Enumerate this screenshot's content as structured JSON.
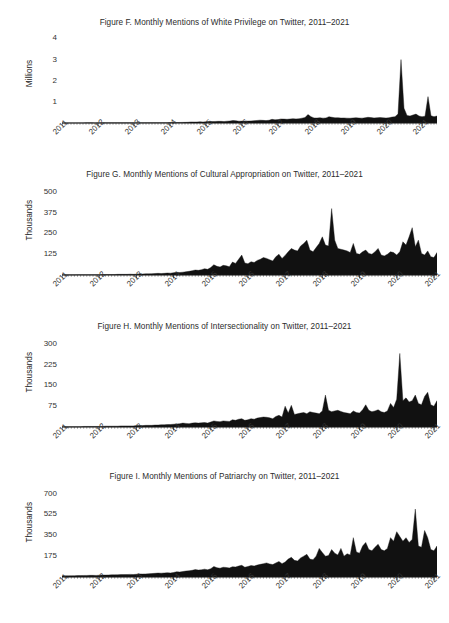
{
  "page": {
    "background": "#ffffff",
    "ink": "#1a1a1a",
    "figure_count": 4
  },
  "chart_data": [
    {
      "id": "figure-f",
      "type": "area",
      "title": "Figure F. Monthly Mentions of White Privilege on Twitter, 2011–2021",
      "xlabel": "",
      "ylabel": "Millions",
      "unit": "Millions",
      "grid": false,
      "legend": "none",
      "fill_color": "#111111",
      "ylim": [
        0,
        4.4
      ],
      "yticks": [
        1,
        2,
        3,
        4
      ],
      "ytick_labels": [
        "1",
        "2",
        "3",
        "4"
      ],
      "xlim": [
        "2011-01",
        "2021-06"
      ],
      "xtick_labels": [
        "2011",
        "2012",
        "2013",
        "2014",
        "2015",
        "2016",
        "2017",
        "2018",
        "2019",
        "2020",
        "2021"
      ],
      "x": [
        "2011-01",
        "2011-02",
        "2011-03",
        "2011-04",
        "2011-05",
        "2011-06",
        "2011-07",
        "2011-08",
        "2011-09",
        "2011-10",
        "2011-11",
        "2011-12",
        "2012-01",
        "2012-02",
        "2012-03",
        "2012-04",
        "2012-05",
        "2012-06",
        "2012-07",
        "2012-08",
        "2012-09",
        "2012-10",
        "2012-11",
        "2012-12",
        "2013-01",
        "2013-02",
        "2013-03",
        "2013-04",
        "2013-05",
        "2013-06",
        "2013-07",
        "2013-08",
        "2013-09",
        "2013-10",
        "2013-11",
        "2013-12",
        "2014-01",
        "2014-02",
        "2014-03",
        "2014-04",
        "2014-05",
        "2014-06",
        "2014-07",
        "2014-08",
        "2014-09",
        "2014-10",
        "2014-11",
        "2014-12",
        "2015-01",
        "2015-02",
        "2015-03",
        "2015-04",
        "2015-05",
        "2015-06",
        "2015-07",
        "2015-08",
        "2015-09",
        "2015-10",
        "2015-11",
        "2015-12",
        "2016-01",
        "2016-02",
        "2016-03",
        "2016-04",
        "2016-05",
        "2016-06",
        "2016-07",
        "2016-08",
        "2016-09",
        "2016-10",
        "2016-11",
        "2016-12",
        "2017-01",
        "2017-02",
        "2017-03",
        "2017-04",
        "2017-05",
        "2017-06",
        "2017-07",
        "2017-08",
        "2017-09",
        "2017-10",
        "2017-11",
        "2017-12",
        "2018-01",
        "2018-02",
        "2018-03",
        "2018-04",
        "2018-05",
        "2018-06",
        "2018-07",
        "2018-08",
        "2018-09",
        "2018-10",
        "2018-11",
        "2018-12",
        "2019-01",
        "2019-02",
        "2019-03",
        "2019-04",
        "2019-05",
        "2019-06",
        "2019-07",
        "2019-08",
        "2019-09",
        "2019-10",
        "2019-11",
        "2019-12",
        "2020-01",
        "2020-02",
        "2020-03",
        "2020-04",
        "2020-05",
        "2020-06",
        "2020-07",
        "2020-08",
        "2020-09",
        "2020-10",
        "2020-11",
        "2020-12",
        "2021-01",
        "2021-02",
        "2021-03",
        "2021-04",
        "2021-05",
        "2021-06"
      ],
      "values": [
        0.004,
        0.004,
        0.005,
        0.005,
        0.004,
        0.005,
        0.005,
        0.005,
        0.006,
        0.006,
        0.006,
        0.005,
        0.006,
        0.007,
        0.007,
        0.007,
        0.007,
        0.008,
        0.007,
        0.008,
        0.008,
        0.009,
        0.009,
        0.008,
        0.01,
        0.012,
        0.011,
        0.011,
        0.012,
        0.013,
        0.014,
        0.015,
        0.014,
        0.015,
        0.016,
        0.015,
        0.018,
        0.022,
        0.021,
        0.024,
        0.028,
        0.03,
        0.034,
        0.05,
        0.046,
        0.048,
        0.055,
        0.048,
        0.06,
        0.075,
        0.07,
        0.072,
        0.08,
        0.078,
        0.07,
        0.085,
        0.095,
        0.12,
        0.105,
        0.085,
        0.09,
        0.095,
        0.092,
        0.098,
        0.11,
        0.12,
        0.135,
        0.125,
        0.115,
        0.13,
        0.175,
        0.15,
        0.16,
        0.19,
        0.185,
        0.175,
        0.19,
        0.205,
        0.195,
        0.2,
        0.23,
        0.26,
        0.4,
        0.3,
        0.24,
        0.235,
        0.25,
        0.23,
        0.24,
        0.3,
        0.27,
        0.245,
        0.25,
        0.235,
        0.24,
        0.23,
        0.225,
        0.24,
        0.25,
        0.235,
        0.23,
        0.245,
        0.27,
        0.255,
        0.24,
        0.25,
        0.26,
        0.245,
        0.235,
        0.25,
        0.28,
        0.3,
        0.42,
        3.0,
        0.7,
        0.36,
        0.33,
        0.38,
        0.42,
        0.33,
        0.3,
        0.32,
        1.25,
        0.34,
        0.3,
        0.33
      ],
      "annotations": [
        {
          "label": "peak",
          "x": "2020-06",
          "y": 3.0
        }
      ]
    },
    {
      "id": "figure-g",
      "type": "area",
      "title": "Figure G. Monthly Mentions of Cultural Appropriation on Twitter, 2011–2021",
      "xlabel": "",
      "ylabel": "Thousands",
      "unit": "Thousands",
      "grid": false,
      "legend": "none",
      "fill_color": "#111111",
      "ylim": [
        0,
        560
      ],
      "yticks": [
        125,
        250,
        375,
        500
      ],
      "ytick_labels": [
        "125",
        "250",
        "375",
        "500"
      ],
      "xlim": [
        "2011-01",
        "2021-06"
      ],
      "xtick_labels": [
        "2011",
        "2012",
        "2013",
        "2014",
        "2015",
        "2016",
        "2017",
        "2018",
        "2019",
        "2020",
        "2021"
      ],
      "x": [
        "2011-01",
        "2011-02",
        "2011-03",
        "2011-04",
        "2011-05",
        "2011-06",
        "2011-07",
        "2011-08",
        "2011-09",
        "2011-10",
        "2011-11",
        "2011-12",
        "2012-01",
        "2012-02",
        "2012-03",
        "2012-04",
        "2012-05",
        "2012-06",
        "2012-07",
        "2012-08",
        "2012-09",
        "2012-10",
        "2012-11",
        "2012-12",
        "2013-01",
        "2013-02",
        "2013-03",
        "2013-04",
        "2013-05",
        "2013-06",
        "2013-07",
        "2013-08",
        "2013-09",
        "2013-10",
        "2013-11",
        "2013-12",
        "2014-01",
        "2014-02",
        "2014-03",
        "2014-04",
        "2014-05",
        "2014-06",
        "2014-07",
        "2014-08",
        "2014-09",
        "2014-10",
        "2014-11",
        "2014-12",
        "2015-01",
        "2015-02",
        "2015-03",
        "2015-04",
        "2015-05",
        "2015-06",
        "2015-07",
        "2015-08",
        "2015-09",
        "2015-10",
        "2015-11",
        "2015-12",
        "2016-01",
        "2016-02",
        "2016-03",
        "2016-04",
        "2016-05",
        "2016-06",
        "2016-07",
        "2016-08",
        "2016-09",
        "2016-10",
        "2016-11",
        "2016-12",
        "2017-01",
        "2017-02",
        "2017-03",
        "2017-04",
        "2017-05",
        "2017-06",
        "2017-07",
        "2017-08",
        "2017-09",
        "2017-10",
        "2017-11",
        "2017-12",
        "2018-01",
        "2018-02",
        "2018-03",
        "2018-04",
        "2018-05",
        "2018-06",
        "2018-07",
        "2018-08",
        "2018-09",
        "2018-10",
        "2018-11",
        "2018-12",
        "2019-01",
        "2019-02",
        "2019-03",
        "2019-04",
        "2019-05",
        "2019-06",
        "2019-07",
        "2019-08",
        "2019-09",
        "2019-10",
        "2019-11",
        "2019-12",
        "2020-01",
        "2020-02",
        "2020-03",
        "2020-04",
        "2020-05",
        "2020-06",
        "2020-07",
        "2020-08",
        "2020-09",
        "2020-10",
        "2020-11",
        "2020-12",
        "2021-01",
        "2021-02",
        "2021-03",
        "2021-04",
        "2021-05",
        "2021-06"
      ],
      "values": [
        1,
        1,
        1,
        1,
        1,
        2,
        2,
        2,
        2,
        2,
        2,
        2,
        2,
        3,
        3,
        3,
        3,
        3,
        4,
        4,
        4,
        4,
        5,
        4,
        5,
        6,
        6,
        7,
        7,
        8,
        9,
        10,
        9,
        10,
        12,
        11,
        14,
        16,
        15,
        17,
        20,
        22,
        26,
        30,
        28,
        32,
        38,
        34,
        45,
        62,
        52,
        48,
        58,
        55,
        50,
        78,
        70,
        95,
        120,
        72,
        68,
        80,
        75,
        88,
        95,
        105,
        100,
        92,
        85,
        110,
        125,
        100,
        118,
        140,
        160,
        150,
        145,
        175,
        190,
        210,
        150,
        140,
        165,
        190,
        230,
        180,
        175,
        400,
        210,
        160,
        155,
        150,
        145,
        135,
        190,
        130,
        125,
        140,
        150,
        130,
        125,
        140,
        160,
        120,
        115,
        125,
        140,
        135,
        120,
        140,
        200,
        180,
        230,
        285,
        170,
        210,
        130,
        120,
        145,
        110,
        105,
        135
      ],
      "annotations": [
        {
          "label": "peak",
          "x": "2018-06",
          "y": 400
        }
      ]
    },
    {
      "id": "figure-h",
      "type": "area",
      "title": "Figure H. Monthly Mentions of Intersectionality on Twitter, 2011–2021",
      "xlabel": "",
      "ylabel": "Thousands",
      "unit": "Thousands",
      "grid": false,
      "legend": "none",
      "fill_color": "#111111",
      "ylim": [
        0,
        335
      ],
      "yticks": [
        75,
        150,
        225,
        300
      ],
      "ytick_labels": [
        "75",
        "150",
        "225",
        "300"
      ],
      "xlim": [
        "2011-01",
        "2021-06"
      ],
      "xtick_labels": [
        "2011",
        "2012",
        "2013",
        "2014",
        "2015",
        "2016",
        "2017",
        "2018",
        "2019",
        "2020",
        "2021"
      ],
      "x": [
        "2011-01",
        "2011-02",
        "2011-03",
        "2011-04",
        "2011-05",
        "2011-06",
        "2011-07",
        "2011-08",
        "2011-09",
        "2011-10",
        "2011-11",
        "2011-12",
        "2012-01",
        "2012-02",
        "2012-03",
        "2012-04",
        "2012-05",
        "2012-06",
        "2012-07",
        "2012-08",
        "2012-09",
        "2012-10",
        "2012-11",
        "2012-12",
        "2013-01",
        "2013-02",
        "2013-03",
        "2013-04",
        "2013-05",
        "2013-06",
        "2013-07",
        "2013-08",
        "2013-09",
        "2013-10",
        "2013-11",
        "2013-12",
        "2014-01",
        "2014-02",
        "2014-03",
        "2014-04",
        "2014-05",
        "2014-06",
        "2014-07",
        "2014-08",
        "2014-09",
        "2014-10",
        "2014-11",
        "2014-12",
        "2015-01",
        "2015-02",
        "2015-03",
        "2015-04",
        "2015-05",
        "2015-06",
        "2015-07",
        "2015-08",
        "2015-09",
        "2015-10",
        "2015-11",
        "2015-12",
        "2016-01",
        "2016-02",
        "2016-03",
        "2016-04",
        "2016-05",
        "2016-06",
        "2016-07",
        "2016-08",
        "2016-09",
        "2016-10",
        "2016-11",
        "2016-12",
        "2017-01",
        "2017-02",
        "2017-03",
        "2017-04",
        "2017-05",
        "2017-06",
        "2017-07",
        "2017-08",
        "2017-09",
        "2017-10",
        "2017-11",
        "2017-12",
        "2018-01",
        "2018-02",
        "2018-03",
        "2018-04",
        "2018-05",
        "2018-06",
        "2018-07",
        "2018-08",
        "2018-09",
        "2018-10",
        "2018-11",
        "2018-12",
        "2019-01",
        "2019-02",
        "2019-03",
        "2019-04",
        "2019-05",
        "2019-06",
        "2019-07",
        "2019-08",
        "2019-09",
        "2019-10",
        "2019-11",
        "2019-12",
        "2020-01",
        "2020-02",
        "2020-03",
        "2020-04",
        "2020-05",
        "2020-06",
        "2020-07",
        "2020-08",
        "2020-09",
        "2020-10",
        "2020-11",
        "2020-12",
        "2021-01",
        "2021-02",
        "2021-03",
        "2021-04",
        "2021-05",
        "2021-06"
      ],
      "values": [
        1,
        1,
        1,
        1,
        1,
        1,
        1,
        2,
        2,
        2,
        2,
        2,
        2,
        2,
        3,
        3,
        3,
        3,
        3,
        4,
        4,
        4,
        4,
        4,
        5,
        5,
        5,
        6,
        6,
        6,
        7,
        7,
        8,
        8,
        9,
        9,
        10,
        11,
        12,
        14,
        13,
        12,
        14,
        15,
        14,
        15,
        16,
        14,
        18,
        22,
        20,
        19,
        22,
        21,
        20,
        26,
        24,
        28,
        30,
        24,
        26,
        30,
        28,
        32,
        34,
        36,
        35,
        33,
        30,
        38,
        42,
        36,
        75,
        50,
        78,
        45,
        48,
        50,
        52,
        48,
        55,
        52,
        50,
        48,
        58,
        115,
        60,
        55,
        58,
        60,
        56,
        52,
        50,
        48,
        58,
        52,
        50,
        62,
        80,
        60,
        55,
        58,
        62,
        55,
        52,
        58,
        85,
        70,
        100,
        265,
        95,
        105,
        90,
        95,
        115,
        85,
        80,
        110,
        125,
        80,
        75,
        95
      ],
      "annotations": [
        {
          "label": "peak",
          "x": "2020-06",
          "y": 265
        }
      ]
    },
    {
      "id": "figure-i",
      "type": "area",
      "title": "Figure I. Monthly Mentions of Patriarchy on Twitter, 2011–2021",
      "xlabel": "",
      "ylabel": "Thousands",
      "unit": "Thousands",
      "grid": false,
      "legend": "none",
      "fill_color": "#111111",
      "ylim": [
        0,
        780
      ],
      "yticks": [
        175,
        350,
        525,
        700
      ],
      "ytick_labels": [
        "175",
        "350",
        "525",
        "700"
      ],
      "xlim": [
        "2011-01",
        "2021-06"
      ],
      "xtick_labels": [
        "2011",
        "2012",
        "2013",
        "2014",
        "2015",
        "2016",
        "2017",
        "2018",
        "2019",
        "2020",
        "2021"
      ],
      "x": [
        "2011-01",
        "2011-02",
        "2011-03",
        "2011-04",
        "2011-05",
        "2011-06",
        "2011-07",
        "2011-08",
        "2011-09",
        "2011-10",
        "2011-11",
        "2011-12",
        "2012-01",
        "2012-02",
        "2012-03",
        "2012-04",
        "2012-05",
        "2012-06",
        "2012-07",
        "2012-08",
        "2012-09",
        "2012-10",
        "2012-11",
        "2012-12",
        "2013-01",
        "2013-02",
        "2013-03",
        "2013-04",
        "2013-05",
        "2013-06",
        "2013-07",
        "2013-08",
        "2013-09",
        "2013-10",
        "2013-11",
        "2013-12",
        "2014-01",
        "2014-02",
        "2014-03",
        "2014-04",
        "2014-05",
        "2014-06",
        "2014-07",
        "2014-08",
        "2014-09",
        "2014-10",
        "2014-11",
        "2014-12",
        "2015-01",
        "2015-02",
        "2015-03",
        "2015-04",
        "2015-05",
        "2015-06",
        "2015-07",
        "2015-08",
        "2015-09",
        "2015-10",
        "2015-11",
        "2015-12",
        "2016-01",
        "2016-02",
        "2016-03",
        "2016-04",
        "2016-05",
        "2016-06",
        "2016-07",
        "2016-08",
        "2016-09",
        "2016-10",
        "2016-11",
        "2016-12",
        "2017-01",
        "2017-02",
        "2017-03",
        "2017-04",
        "2017-05",
        "2017-06",
        "2017-07",
        "2017-08",
        "2017-09",
        "2017-10",
        "2017-11",
        "2017-12",
        "2018-01",
        "2018-02",
        "2018-03",
        "2018-04",
        "2018-05",
        "2018-06",
        "2018-07",
        "2018-08",
        "2018-09",
        "2018-10",
        "2018-11",
        "2018-12",
        "2019-01",
        "2019-02",
        "2019-03",
        "2019-04",
        "2019-05",
        "2019-06",
        "2019-07",
        "2019-08",
        "2019-09",
        "2019-10",
        "2019-11",
        "2019-12",
        "2020-01",
        "2020-02",
        "2020-03",
        "2020-04",
        "2020-05",
        "2020-06",
        "2020-07",
        "2020-08",
        "2020-09",
        "2020-10",
        "2020-11",
        "2020-12",
        "2021-01",
        "2021-02",
        "2021-03",
        "2021-04",
        "2021-05",
        "2021-06"
      ],
      "values": [
        9,
        10,
        10,
        11,
        11,
        12,
        12,
        13,
        13,
        14,
        14,
        13,
        15,
        16,
        16,
        17,
        18,
        18,
        19,
        20,
        20,
        21,
        22,
        21,
        23,
        26,
        25,
        26,
        28,
        29,
        31,
        33,
        32,
        34,
        36,
        34,
        38,
        44,
        42,
        46,
        50,
        52,
        56,
        62,
        58,
        60,
        66,
        60,
        70,
        88,
        78,
        74,
        82,
        80,
        76,
        86,
        84,
        92,
        98,
        82,
        88,
        96,
        92,
        100,
        106,
        112,
        118,
        110,
        104,
        118,
        130,
        112,
        125,
        150,
        165,
        140,
        135,
        160,
        175,
        190,
        150,
        145,
        175,
        240,
        205,
        175,
        180,
        230,
        200,
        185,
        240,
        175,
        195,
        185,
        330,
        210,
        200,
        260,
        290,
        230,
        220,
        250,
        275,
        230,
        220,
        240,
        330,
        300,
        380,
        340,
        300,
        330,
        290,
        315,
        570,
        260,
        250,
        390,
        330,
        230,
        220,
        260
      ],
      "annotations": [
        {
          "label": "peak",
          "x": "2020-11",
          "y": 570
        }
      ]
    }
  ]
}
